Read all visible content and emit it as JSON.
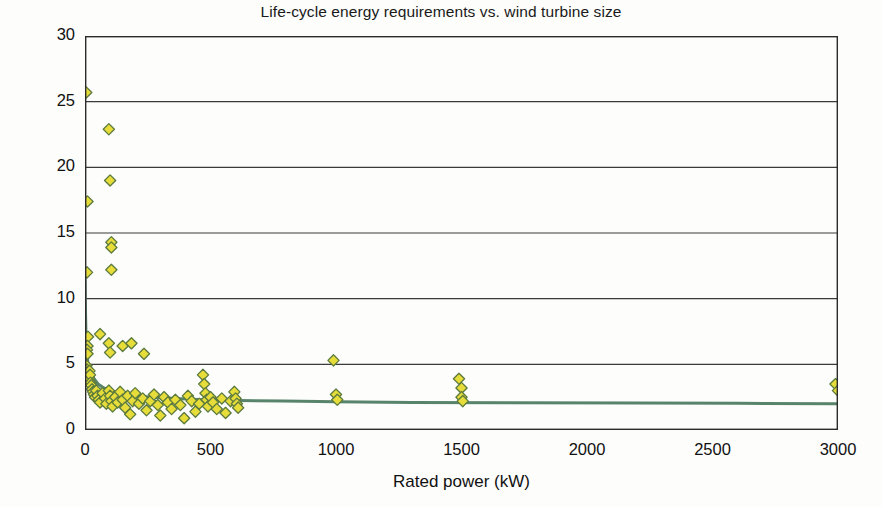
{
  "chart_data": {
    "type": "scatter",
    "title": "Life-cycle energy requirements vs. wind turbine size",
    "xlabel": "Rated power (kW)",
    "ylabel": "Embodied energy (MWh)",
    "xlim": [
      0,
      3000
    ],
    "ylim": [
      0,
      30
    ],
    "xticks": [
      0,
      500,
      1000,
      1500,
      2000,
      2500,
      3000
    ],
    "yticks": [
      0,
      5,
      10,
      15,
      20,
      25,
      30
    ],
    "grid": "horizontal",
    "legend": "none",
    "marker": {
      "shape": "diamond",
      "fill_color": "#e6dc3a",
      "edge_color": "#5c7a3c",
      "size_px": 9
    },
    "series": [
      {
        "name": "Embodied energy observations",
        "type": "scatter",
        "points": [
          [
            5,
            25.7
          ],
          [
            10,
            17.4
          ],
          [
            8,
            12.0
          ],
          [
            95,
            22.9
          ],
          [
            100,
            19.0
          ],
          [
            105,
            14.3
          ],
          [
            105,
            13.9
          ],
          [
            105,
            12.2
          ],
          [
            12,
            7.1
          ],
          [
            10,
            6.4
          ],
          [
            8,
            6.1
          ],
          [
            10,
            5.8
          ],
          [
            60,
            7.3
          ],
          [
            95,
            6.6
          ],
          [
            100,
            5.9
          ],
          [
            150,
            6.4
          ],
          [
            185,
            6.6
          ],
          [
            235,
            5.8
          ],
          [
            6,
            4.9
          ],
          [
            8,
            4.6
          ],
          [
            10,
            4.4
          ],
          [
            12,
            4.3
          ],
          [
            14,
            4.1
          ],
          [
            16,
            3.9
          ],
          [
            18,
            4.5
          ],
          [
            20,
            4.2
          ],
          [
            22,
            3.6
          ],
          [
            25,
            3.4
          ],
          [
            28,
            3.1
          ],
          [
            32,
            2.9
          ],
          [
            36,
            2.7
          ],
          [
            40,
            2.5
          ],
          [
            45,
            3.0
          ],
          [
            50,
            2.6
          ],
          [
            55,
            2.3
          ],
          [
            60,
            2.1
          ],
          [
            70,
            2.8
          ],
          [
            80,
            2.4
          ],
          [
            85,
            2.0
          ],
          [
            95,
            3.0
          ],
          [
            100,
            2.6
          ],
          [
            105,
            2.2
          ],
          [
            110,
            1.8
          ],
          [
            120,
            2.5
          ],
          [
            130,
            2.1
          ],
          [
            140,
            2.9
          ],
          [
            150,
            2.3
          ],
          [
            160,
            1.7
          ],
          [
            170,
            2.6
          ],
          [
            180,
            1.2
          ],
          [
            190,
            2.2
          ],
          [
            200,
            2.8
          ],
          [
            215,
            2.0
          ],
          [
            230,
            2.4
          ],
          [
            245,
            1.5
          ],
          [
            260,
            2.2
          ],
          [
            275,
            2.7
          ],
          [
            290,
            1.9
          ],
          [
            300,
            1.1
          ],
          [
            315,
            2.5
          ],
          [
            330,
            2.1
          ],
          [
            345,
            1.6
          ],
          [
            360,
            2.3
          ],
          [
            380,
            1.9
          ],
          [
            395,
            0.9
          ],
          [
            410,
            2.6
          ],
          [
            425,
            2.2
          ],
          [
            440,
            1.4
          ],
          [
            455,
            2.0
          ],
          [
            470,
            4.2
          ],
          [
            475,
            3.5
          ],
          [
            480,
            2.8
          ],
          [
            485,
            2.3
          ],
          [
            490,
            1.8
          ],
          [
            500,
            2.5
          ],
          [
            510,
            2.1
          ],
          [
            525,
            1.6
          ],
          [
            545,
            2.4
          ],
          [
            560,
            1.3
          ],
          [
            580,
            2.2
          ],
          [
            595,
            2.9
          ],
          [
            600,
            2.4
          ],
          [
            605,
            2.0
          ],
          [
            610,
            1.7
          ],
          [
            990,
            5.3
          ],
          [
            1000,
            2.7
          ],
          [
            1005,
            2.3
          ],
          [
            1490,
            3.9
          ],
          [
            1500,
            3.2
          ],
          [
            1500,
            2.5
          ],
          [
            1505,
            2.2
          ],
          [
            2990,
            3.5
          ],
          [
            3000,
            3.0
          ]
        ]
      },
      {
        "name": "Fitted power-law trend",
        "type": "line",
        "color": "#4a7a5e",
        "width_px": 3,
        "points": [
          [
            0,
            12.0
          ],
          [
            2,
            9.0
          ],
          [
            4,
            7.2
          ],
          [
            7,
            6.0
          ],
          [
            11,
            5.2
          ],
          [
            16,
            4.7
          ],
          [
            24,
            4.3
          ],
          [
            36,
            3.9
          ],
          [
            52,
            3.5
          ],
          [
            75,
            3.2
          ],
          [
            105,
            3.0
          ],
          [
            145,
            2.8
          ],
          [
            200,
            2.6
          ],
          [
            270,
            2.5
          ],
          [
            360,
            2.4
          ],
          [
            470,
            2.3
          ],
          [
            610,
            2.25
          ],
          [
            790,
            2.2
          ],
          [
            1000,
            2.15
          ],
          [
            1300,
            2.1
          ],
          [
            1700,
            2.08
          ],
          [
            2200,
            2.05
          ],
          [
            2600,
            2.03
          ],
          [
            3000,
            2.0
          ]
        ]
      }
    ]
  }
}
